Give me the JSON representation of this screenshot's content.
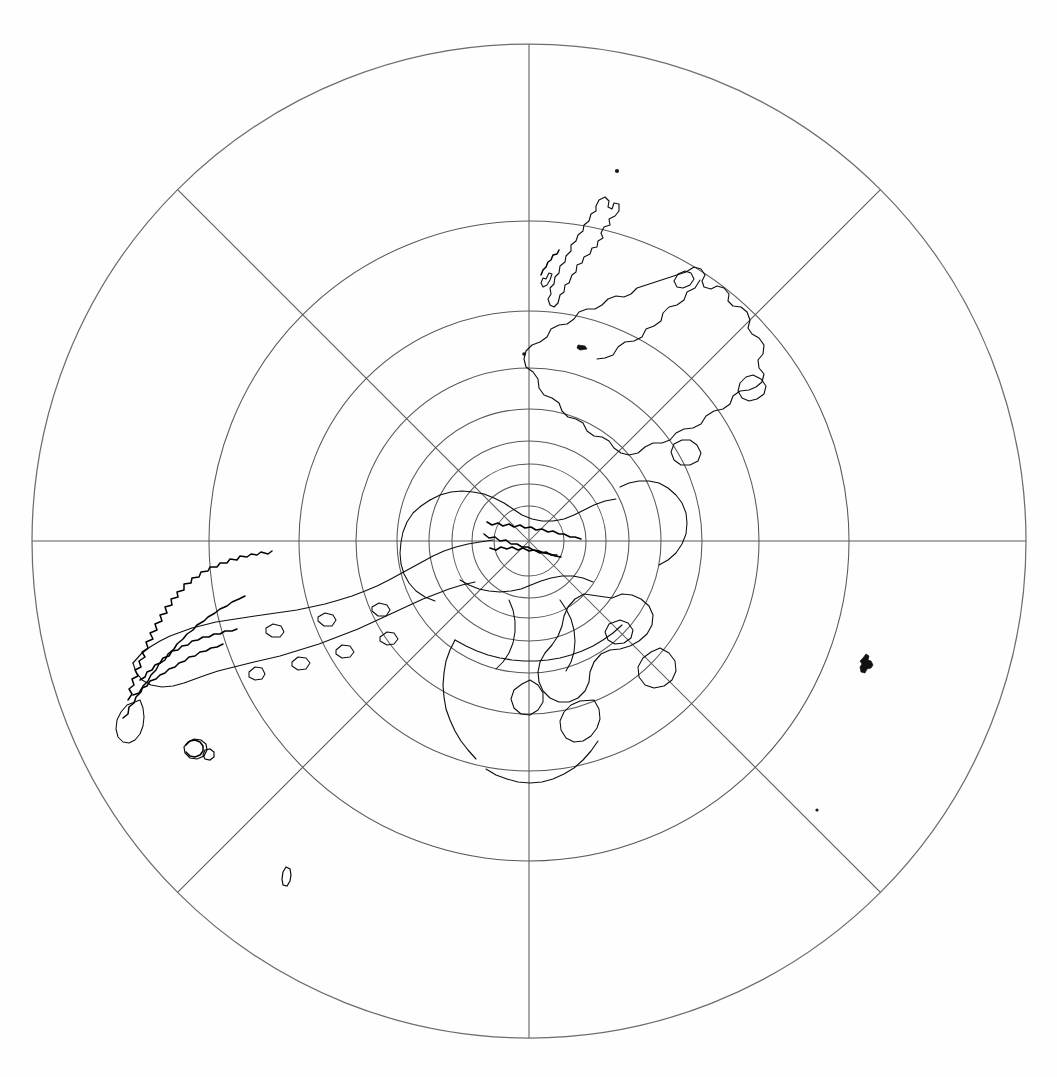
{
  "document": {
    "title": "Polar Azimuthal Projection Map",
    "kind": "line-art map figure",
    "background_color": "#ffffff",
    "line_color": "#101010",
    "graticule_color": "#55585c",
    "width_px": 1057,
    "height_px": 1077
  },
  "map": {
    "projection_name": "polar azimuthal perspective projection",
    "hemisphere_label": "polar aspect",
    "center_x_px": 529,
    "center_y_px": 541,
    "outer_radius_px": 497,
    "pole_marker": "center convergence point",
    "meridian_interval_degrees": 45,
    "meridian_count": 8,
    "meridian_bearings_degrees": [
      0,
      45,
      90,
      135,
      180,
      225,
      270,
      315
    ],
    "parallel_count": 9,
    "parallel_radii_px": [
      35,
      57,
      77,
      100,
      132,
      173,
      230,
      320,
      497
    ],
    "parallel_latitudes_degrees": [
      80,
      70,
      60,
      50,
      40,
      30,
      20,
      10,
      0
    ],
    "graticule_visible": true,
    "grid_style": "thin continuous lines",
    "coastline_style": "unfilled outline",
    "features": [
      {
        "name": "central-polar-landmass-cluster",
        "description": "dense convergent coastlines around the projection centre"
      },
      {
        "name": "western-peninsula-archipelago",
        "description": "long west-trending peninsula with heavily crenulated fjord coastline and offshore island scatter"
      },
      {
        "name": "northeast-elongated-island-chain",
        "description": "narrow island chain trending north-northeast in the upper sector"
      },
      {
        "name": "eastern-continental-mass",
        "description": "large landmass occupying the east-northeast sector"
      },
      {
        "name": "southeast-coastal-lobe",
        "description": "rounded coastal lobe projecting into the lower-right quadrant"
      },
      {
        "name": "isolated-islet-east",
        "description": "small solid islet far east of the main coasts"
      },
      {
        "name": "isolated-islet-southwest",
        "description": "small hooked islet in the lower-left quadrant"
      },
      {
        "name": "isolated-islet-north",
        "description": "tiny speck islet in the upper sector"
      }
    ]
  },
  "chart_data": {
    "type": "map",
    "projection": "azimuthal polar perspective",
    "center": [
      529,
      541
    ],
    "radius": 497,
    "graticule": {
      "meridian_spacing_deg": 45,
      "parallel_radii": [
        35,
        57,
        77,
        100,
        132,
        173,
        230,
        320,
        497
      ],
      "grid": true,
      "legend": "none"
    },
    "xlabel": "",
    "ylabel": ""
  }
}
